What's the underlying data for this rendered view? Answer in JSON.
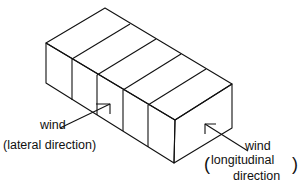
{
  "diagram": {
    "type": "isometric-building-block",
    "segments": 5,
    "labels": {
      "lateral": {
        "word": "wind",
        "detail": "(lateral direction)"
      },
      "longitudinal": {
        "word": "wind",
        "detail_line1": "longitudinal",
        "detail_line2": "direction",
        "paren_open": "(",
        "paren_close": ")"
      }
    },
    "colors": {
      "line": "#111111",
      "background": "#ffffff"
    }
  }
}
